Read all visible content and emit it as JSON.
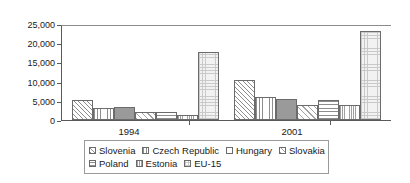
{
  "chart_data": {
    "type": "bar",
    "title": "",
    "subtitle": "",
    "xlabel": "",
    "ylabel": "EUR",
    "categories": [
      "1994",
      "2001"
    ],
    "ylim": [
      0,
      25000
    ],
    "ytick_values": [
      0,
      5000,
      10000,
      15000,
      20000,
      25000
    ],
    "ytick_labels": [
      "0",
      "5,000",
      "10,000",
      "15,000",
      "20,000",
      "25,000"
    ],
    "grid": false,
    "legend_position": "bottom",
    "series": [
      {
        "name": "Slovenia",
        "pattern": "diagonal-hatch",
        "values": [
          5300,
          10400
        ]
      },
      {
        "name": "Czech Republic",
        "pattern": "vertical-lines",
        "values": [
          3200,
          5900
        ]
      },
      {
        "name": "Hungary",
        "pattern": "solid-gray",
        "values": [
          3300,
          5500
        ]
      },
      {
        "name": "Slovakia",
        "pattern": "diagonal-hatch-light",
        "values": [
          2200,
          4000
        ]
      },
      {
        "name": "Poland",
        "pattern": "horizontal-lines",
        "values": [
          2100,
          5100
        ]
      },
      {
        "name": "Estonia",
        "pattern": "fine-vertical-lines",
        "values": [
          1300,
          4000
        ]
      },
      {
        "name": "EU-15",
        "pattern": "checker-grid",
        "values": [
          17600,
          23100
        ]
      }
    ]
  },
  "axis": {
    "y_title": "EUR",
    "ticks": [
      "25,000",
      "20,000",
      "15,000",
      "10,000",
      "5,000",
      "0"
    ]
  },
  "legend": {
    "row1": [
      "Slovenia",
      "Czech Republic",
      "Hungary",
      "Slovakia"
    ],
    "row2": [
      "Poland",
      "Estonia",
      "EU-15"
    ]
  },
  "colors": {
    "axis": "#5a5a5a",
    "bar_outline": "#6b6b6b",
    "hatch": "#8e8e8e",
    "solid_fill": "#9a9a9a",
    "grid_fill": "#c9c9c9",
    "background": "#ffffff",
    "text": "#1a1a1a"
  }
}
